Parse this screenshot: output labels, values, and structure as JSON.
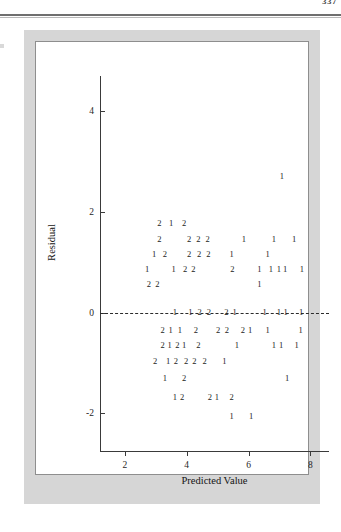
{
  "page": {
    "page_number": "337",
    "header_rule": "double-rule"
  },
  "figure": {
    "frame_color": "#d6d6d6",
    "panel_color": "#ffffff",
    "axis_color": "#3a3a3a"
  },
  "chart_data": {
    "type": "scatter",
    "title": "",
    "subtitle": "",
    "xlabel": "Predicted Value",
    "ylabel": "Residual",
    "xlim": [
      1.2,
      8.6
    ],
    "ylim": [
      -2.75,
      4.7
    ],
    "xticks": [
      2,
      4,
      6,
      8
    ],
    "xtick_labels": [
      "2",
      "4",
      "6",
      "8"
    ],
    "yticks": [
      4,
      2,
      0,
      -2
    ],
    "ytick_labels": [
      "4",
      "2",
      "0",
      "-2"
    ],
    "grid": false,
    "legend": null,
    "reference_lines": [
      {
        "orientation": "horizontal",
        "y": 0,
        "style": "dashed",
        "color": "#2b2b2b"
      }
    ],
    "marker_style": "count-digit",
    "points": [
      {
        "x": 7.08,
        "y": 2.72,
        "label": "1"
      },
      {
        "x": 3.12,
        "y": 1.78,
        "label": "2"
      },
      {
        "x": 3.5,
        "y": 1.78,
        "label": "1"
      },
      {
        "x": 3.92,
        "y": 1.78,
        "label": "2"
      },
      {
        "x": 3.12,
        "y": 1.47,
        "label": "2"
      },
      {
        "x": 4.08,
        "y": 1.47,
        "label": "2"
      },
      {
        "x": 4.38,
        "y": 1.47,
        "label": "2"
      },
      {
        "x": 4.68,
        "y": 1.47,
        "label": "2"
      },
      {
        "x": 5.85,
        "y": 1.47,
        "label": "1"
      },
      {
        "x": 6.82,
        "y": 1.47,
        "label": "1"
      },
      {
        "x": 7.47,
        "y": 1.47,
        "label": "1"
      },
      {
        "x": 2.95,
        "y": 1.17,
        "label": "1"
      },
      {
        "x": 3.3,
        "y": 1.17,
        "label": "2"
      },
      {
        "x": 4.08,
        "y": 1.17,
        "label": "2"
      },
      {
        "x": 4.4,
        "y": 1.17,
        "label": "2"
      },
      {
        "x": 4.7,
        "y": 1.17,
        "label": "2"
      },
      {
        "x": 5.45,
        "y": 1.17,
        "label": "1"
      },
      {
        "x": 6.62,
        "y": 1.17,
        "label": "1"
      },
      {
        "x": 2.72,
        "y": 0.86,
        "label": "1"
      },
      {
        "x": 3.58,
        "y": 0.86,
        "label": "1"
      },
      {
        "x": 3.95,
        "y": 0.86,
        "label": "2"
      },
      {
        "x": 4.22,
        "y": 0.86,
        "label": "2"
      },
      {
        "x": 5.48,
        "y": 0.86,
        "label": "2"
      },
      {
        "x": 6.35,
        "y": 0.86,
        "label": "1"
      },
      {
        "x": 6.72,
        "y": 0.86,
        "label": "1"
      },
      {
        "x": 6.98,
        "y": 0.86,
        "label": "1"
      },
      {
        "x": 7.18,
        "y": 0.86,
        "label": "1"
      },
      {
        "x": 7.72,
        "y": 0.86,
        "label": "1"
      },
      {
        "x": 2.78,
        "y": 0.56,
        "label": "2"
      },
      {
        "x": 3.05,
        "y": 0.56,
        "label": "2"
      },
      {
        "x": 6.35,
        "y": 0.56,
        "label": "1"
      },
      {
        "x": 3.62,
        "y": 0.02,
        "label": "1"
      },
      {
        "x": 4.12,
        "y": 0.02,
        "label": "1"
      },
      {
        "x": 4.42,
        "y": 0.02,
        "label": "2"
      },
      {
        "x": 4.72,
        "y": 0.02,
        "label": "2"
      },
      {
        "x": 5.28,
        "y": 0.02,
        "label": "2"
      },
      {
        "x": 5.55,
        "y": 0.02,
        "label": "1"
      },
      {
        "x": 6.52,
        "y": 0.02,
        "label": "1"
      },
      {
        "x": 6.98,
        "y": 0.02,
        "label": "1"
      },
      {
        "x": 7.2,
        "y": 0.02,
        "label": "1"
      },
      {
        "x": 7.7,
        "y": 0.02,
        "label": "1"
      },
      {
        "x": 3.22,
        "y": -0.34,
        "label": "2"
      },
      {
        "x": 3.48,
        "y": -0.34,
        "label": "1"
      },
      {
        "x": 3.78,
        "y": -0.34,
        "label": "1"
      },
      {
        "x": 4.3,
        "y": -0.34,
        "label": "2"
      },
      {
        "x": 5.02,
        "y": -0.34,
        "label": "2"
      },
      {
        "x": 5.3,
        "y": -0.34,
        "label": "2"
      },
      {
        "x": 5.82,
        "y": -0.34,
        "label": "2"
      },
      {
        "x": 6.05,
        "y": -0.34,
        "label": "1"
      },
      {
        "x": 6.62,
        "y": -0.34,
        "label": "1"
      },
      {
        "x": 7.68,
        "y": -0.34,
        "label": "1"
      },
      {
        "x": 3.22,
        "y": -0.64,
        "label": "2"
      },
      {
        "x": 3.45,
        "y": -0.64,
        "label": "1"
      },
      {
        "x": 3.7,
        "y": -0.64,
        "label": "2"
      },
      {
        "x": 3.92,
        "y": -0.64,
        "label": "1"
      },
      {
        "x": 4.38,
        "y": -0.64,
        "label": "2"
      },
      {
        "x": 5.62,
        "y": -0.64,
        "label": "1"
      },
      {
        "x": 6.82,
        "y": -0.64,
        "label": "1"
      },
      {
        "x": 7.05,
        "y": -0.64,
        "label": "1"
      },
      {
        "x": 7.55,
        "y": -0.64,
        "label": "1"
      },
      {
        "x": 2.98,
        "y": -0.96,
        "label": "2"
      },
      {
        "x": 3.4,
        "y": -0.96,
        "label": "1"
      },
      {
        "x": 3.65,
        "y": -0.96,
        "label": "2"
      },
      {
        "x": 3.98,
        "y": -0.96,
        "label": "2"
      },
      {
        "x": 4.25,
        "y": -0.96,
        "label": "2"
      },
      {
        "x": 4.58,
        "y": -0.96,
        "label": "2"
      },
      {
        "x": 5.22,
        "y": -0.96,
        "label": "1"
      },
      {
        "x": 3.3,
        "y": -1.3,
        "label": "1"
      },
      {
        "x": 3.92,
        "y": -1.3,
        "label": "2"
      },
      {
        "x": 7.25,
        "y": -1.3,
        "label": "1"
      },
      {
        "x": 3.62,
        "y": -1.68,
        "label": "1"
      },
      {
        "x": 3.85,
        "y": -1.68,
        "label": "2"
      },
      {
        "x": 4.75,
        "y": -1.68,
        "label": "2"
      },
      {
        "x": 4.98,
        "y": -1.68,
        "label": "1"
      },
      {
        "x": 5.45,
        "y": -1.68,
        "label": "2"
      },
      {
        "x": 5.45,
        "y": -2.05,
        "label": "1"
      },
      {
        "x": 6.08,
        "y": -2.05,
        "label": "1"
      }
    ]
  }
}
